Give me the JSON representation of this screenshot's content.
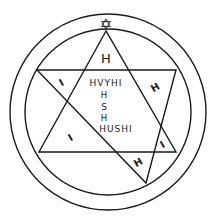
{
  "diagram": {
    "type": "magical-seal",
    "colors": {
      "ink": "#1a1a1a",
      "background": "#ffffff"
    },
    "top_symbol": "hexagram-icon",
    "apex_letter": "H",
    "center_text": {
      "line1": "HVYHI",
      "line2": "H",
      "line3": "S",
      "line4": "H",
      "line5": "HUSHI"
    },
    "corner_glyphs": [
      "I",
      "H",
      "I",
      "H",
      "I"
    ]
  }
}
